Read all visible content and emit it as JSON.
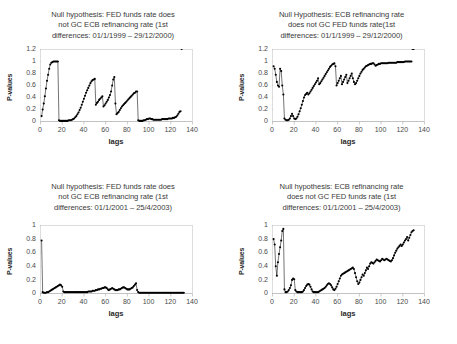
{
  "figure": {
    "panel_count": 4,
    "marker_color": "#000000",
    "frame_color": "#cfcfcf",
    "background": "#ffffff"
  },
  "chart_data": [
    {
      "type": "line",
      "panel": "top-left",
      "title": "Null hypothesis: FED funds rate does\nnot GC ECB refinancing rate (1st\ndifferences: 01/1/1999 – 29/12/2000)",
      "xlabel": "lags",
      "ylabel": "P-values",
      "xlim": [
        0,
        140
      ],
      "ylim": [
        0,
        1.2
      ],
      "xticks": [
        0,
        20,
        40,
        60,
        80,
        100,
        120,
        140
      ],
      "yticks": [
        0,
        0.2,
        0.4,
        0.6,
        0.8,
        1,
        1.2
      ],
      "grid": false,
      "legend": "none",
      "x": [
        1,
        2,
        3,
        4,
        5,
        6,
        7,
        8,
        9,
        10,
        11,
        12,
        13,
        14,
        15,
        16,
        17,
        18,
        19,
        20,
        21,
        22,
        23,
        24,
        25,
        26,
        27,
        28,
        29,
        30,
        31,
        32,
        33,
        34,
        35,
        36,
        37,
        38,
        39,
        40,
        41,
        42,
        43,
        44,
        45,
        46,
        47,
        48,
        49,
        50,
        51,
        52,
        53,
        54,
        55,
        56,
        57,
        58,
        59,
        60,
        61,
        62,
        63,
        64,
        65,
        66,
        67,
        68,
        69,
        70,
        71,
        72,
        73,
        74,
        75,
        76,
        77,
        78,
        79,
        80,
        81,
        82,
        83,
        84,
        85,
        86,
        87,
        88,
        89,
        90,
        91,
        92,
        93,
        94,
        95,
        96,
        97,
        98,
        99,
        100,
        101,
        102,
        103,
        104,
        105,
        106,
        107,
        108,
        109,
        110,
        111,
        112,
        113,
        114,
        115,
        116,
        117,
        118,
        119,
        120,
        121,
        122,
        123,
        124,
        125,
        126,
        127,
        128,
        129,
        130
      ],
      "y": [
        0.09,
        0.2,
        0.3,
        0.42,
        0.55,
        0.68,
        0.78,
        0.88,
        0.95,
        0.98,
        0.99,
        1.0,
        1.0,
        1.0,
        1.0,
        1.0,
        0.02,
        0.01,
        0.01,
        0.01,
        0.01,
        0.01,
        0.01,
        0.01,
        0.01,
        0.02,
        0.02,
        0.02,
        0.03,
        0.04,
        0.05,
        0.07,
        0.09,
        0.12,
        0.15,
        0.19,
        0.23,
        0.28,
        0.33,
        0.38,
        0.43,
        0.48,
        0.52,
        0.56,
        0.6,
        0.64,
        0.67,
        0.69,
        0.7,
        0.71,
        0.28,
        0.31,
        0.33,
        0.36,
        0.38,
        0.4,
        0.42,
        0.25,
        0.27,
        0.3,
        0.33,
        0.36,
        0.4,
        0.44,
        0.5,
        0.6,
        0.7,
        0.74,
        0.3,
        0.12,
        0.14,
        0.16,
        0.19,
        0.22,
        0.25,
        0.27,
        0.29,
        0.31,
        0.33,
        0.35,
        0.37,
        0.39,
        0.41,
        0.43,
        0.45,
        0.47,
        0.48,
        0.5,
        0.5,
        0.02,
        0.01,
        0.01,
        0.01,
        0.01,
        0.02,
        0.02,
        0.03,
        0.04,
        0.04,
        0.05,
        0.05,
        0.04,
        0.04,
        0.03,
        0.03,
        0.03,
        0.03,
        0.03,
        0.03,
        0.03,
        0.03,
        0.04,
        0.04,
        0.04,
        0.04,
        0.04,
        0.04,
        0.05,
        0.05,
        0.05,
        0.05,
        0.06,
        0.06,
        0.07,
        0.08,
        0.1,
        0.13,
        0.16,
        0.17
      ]
    },
    {
      "type": "line",
      "panel": "top-right",
      "title": "Null Hypothesis: ECB refinancing rate\ndoes not GC FED funds rate(1st\ndifferences: 01/1/1999 – 29/12/2000)",
      "xlabel": "lags",
      "ylabel": "P-values",
      "xlim": [
        0,
        140
      ],
      "ylim": [
        0,
        1.2
      ],
      "xticks": [
        0,
        20,
        40,
        60,
        80,
        100,
        120,
        140
      ],
      "yticks": [
        0,
        0.2,
        0.4,
        0.6,
        0.8,
        1,
        1.2
      ],
      "grid": false,
      "legend": "none",
      "x": [
        1,
        2,
        3,
        4,
        5,
        6,
        7,
        8,
        9,
        10,
        11,
        12,
        13,
        14,
        15,
        16,
        17,
        18,
        19,
        20,
        21,
        22,
        23,
        24,
        25,
        26,
        27,
        28,
        29,
        30,
        31,
        32,
        33,
        34,
        35,
        36,
        37,
        38,
        39,
        40,
        41,
        42,
        43,
        44,
        45,
        46,
        47,
        48,
        49,
        50,
        51,
        52,
        53,
        54,
        55,
        56,
        57,
        58,
        59,
        60,
        61,
        62,
        63,
        64,
        65,
        66,
        67,
        68,
        69,
        70,
        71,
        72,
        73,
        74,
        75,
        76,
        77,
        78,
        79,
        80,
        81,
        82,
        83,
        84,
        85,
        86,
        87,
        88,
        89,
        90,
        91,
        92,
        93,
        94,
        95,
        96,
        97,
        98,
        99,
        100,
        101,
        102,
        103,
        104,
        105,
        106,
        107,
        108,
        109,
        110,
        111,
        112,
        113,
        114,
        115,
        116,
        117,
        118,
        119,
        120,
        121,
        122,
        123,
        124,
        125,
        126,
        127,
        128,
        129,
        130
      ],
      "y": [
        0.92,
        0.88,
        0.78,
        0.66,
        0.6,
        0.58,
        0.88,
        0.84,
        0.6,
        0.45,
        0.05,
        0.03,
        0.02,
        0.02,
        0.03,
        0.05,
        0.09,
        0.13,
        0.09,
        0.05,
        0.04,
        0.05,
        0.08,
        0.12,
        0.17,
        0.22,
        0.28,
        0.34,
        0.4,
        0.44,
        0.46,
        0.48,
        0.45,
        0.47,
        0.5,
        0.53,
        0.56,
        0.59,
        0.62,
        0.65,
        0.68,
        0.72,
        0.62,
        0.64,
        0.67,
        0.7,
        0.73,
        0.76,
        0.79,
        0.82,
        0.85,
        0.88,
        0.91,
        0.93,
        0.95,
        0.96,
        0.97,
        0.92,
        0.6,
        0.64,
        0.68,
        0.72,
        0.76,
        0.62,
        0.66,
        0.7,
        0.74,
        0.78,
        0.64,
        0.68,
        0.72,
        0.76,
        0.8,
        0.72,
        0.66,
        0.62,
        0.64,
        0.68,
        0.72,
        0.76,
        0.8,
        0.83,
        0.86,
        0.88,
        0.9,
        0.92,
        0.93,
        0.94,
        0.95,
        0.96,
        0.96,
        0.97,
        0.97,
        0.95,
        0.93,
        0.94,
        0.95,
        0.96,
        0.96,
        0.97,
        0.97,
        0.97,
        0.97,
        0.97,
        0.97,
        0.97,
        0.98,
        0.98,
        0.98,
        0.98,
        0.98,
        0.98,
        0.98,
        0.98,
        0.99,
        0.99,
        0.99,
        0.99,
        0.99,
        0.99,
        0.99,
        1.0,
        1.0,
        1.0,
        1.0,
        1.0,
        1.0,
        1.0
      ]
    },
    {
      "type": "line",
      "panel": "bottom-left",
      "title": "Null hypothesis: FED funds rate does\nnot GC ECB refinancing rate (1st\ndifferences: 01/1/2001 – 25/4/2003)",
      "xlabel": "lags",
      "ylabel": "P-values",
      "xlim": [
        0,
        140
      ],
      "ylim": [
        0,
        1
      ],
      "xticks": [
        0,
        20,
        40,
        60,
        80,
        100,
        120,
        140
      ],
      "yticks": [
        0,
        0.2,
        0.4,
        0.6,
        0.8,
        1
      ],
      "grid": false,
      "legend": "none",
      "x": [
        1,
        2,
        3,
        4,
        5,
        6,
        7,
        8,
        9,
        10,
        11,
        12,
        13,
        14,
        15,
        16,
        17,
        18,
        19,
        20,
        21,
        22,
        23,
        24,
        25,
        26,
        27,
        28,
        29,
        30,
        31,
        32,
        33,
        34,
        35,
        36,
        37,
        38,
        39,
        40,
        41,
        42,
        43,
        44,
        45,
        46,
        47,
        48,
        49,
        50,
        51,
        52,
        53,
        54,
        55,
        56,
        57,
        58,
        59,
        60,
        61,
        62,
        63,
        64,
        65,
        66,
        67,
        68,
        69,
        70,
        71,
        72,
        73,
        74,
        75,
        76,
        77,
        78,
        79,
        80,
        81,
        82,
        83,
        84,
        85,
        86,
        87,
        88,
        89,
        90,
        91,
        92,
        93,
        94,
        95,
        96,
        97,
        98,
        99,
        100,
        101,
        102,
        103,
        104,
        105,
        106,
        107,
        108,
        109,
        110,
        111,
        112,
        113,
        114,
        115,
        116,
        117,
        118,
        119,
        120,
        121,
        122,
        123,
        124,
        125,
        126,
        127,
        128,
        129,
        130,
        131,
        132
      ],
      "y": [
        0.78,
        0.02,
        0.01,
        0.01,
        0.01,
        0.02,
        0.02,
        0.03,
        0.04,
        0.05,
        0.06,
        0.07,
        0.08,
        0.09,
        0.1,
        0.11,
        0.12,
        0.13,
        0.12,
        0.1,
        0.03,
        0.02,
        0.02,
        0.02,
        0.02,
        0.02,
        0.02,
        0.02,
        0.02,
        0.02,
        0.02,
        0.02,
        0.02,
        0.02,
        0.02,
        0.02,
        0.02,
        0.02,
        0.02,
        0.02,
        0.02,
        0.02,
        0.02,
        0.03,
        0.03,
        0.03,
        0.03,
        0.04,
        0.04,
        0.04,
        0.05,
        0.05,
        0.06,
        0.06,
        0.07,
        0.07,
        0.08,
        0.08,
        0.09,
        0.09,
        0.08,
        0.06,
        0.05,
        0.06,
        0.07,
        0.08,
        0.07,
        0.06,
        0.05,
        0.05,
        0.05,
        0.06,
        0.06,
        0.07,
        0.08,
        0.09,
        0.09,
        0.08,
        0.07,
        0.06,
        0.06,
        0.06,
        0.07,
        0.08,
        0.09,
        0.11,
        0.13,
        0.15,
        0.05,
        0.02,
        0.01,
        0.01,
        0.01,
        0.01,
        0.01,
        0.01,
        0.01,
        0.01,
        0.01,
        0.01,
        0.01,
        0.01,
        0.01,
        0.01,
        0.01,
        0.01,
        0.01,
        0.01,
        0.01,
        0.01,
        0.01,
        0.01,
        0.01,
        0.01,
        0.01,
        0.01,
        0.01,
        0.01,
        0.01,
        0.01,
        0.01,
        0.01,
        0.01,
        0.01,
        0.01,
        0.01,
        0.01,
        0.01,
        0.01,
        0.01,
        0.01,
        0.01
      ]
    },
    {
      "type": "line",
      "panel": "bottom-right",
      "title": "Null hypothesis: ECB refinancing rate\ndoes not GC FED funds rate (1st\ndifferences: 01/1/2001 – 25/4/2003)",
      "xlabel": "lags",
      "ylabel": "P-values",
      "xlim": [
        0,
        140
      ],
      "ylim": [
        0,
        1
      ],
      "xticks": [
        0,
        20,
        40,
        60,
        80,
        100,
        120,
        140
      ],
      "yticks": [
        0,
        0.2,
        0.4,
        0.6,
        0.8,
        1
      ],
      "grid": false,
      "legend": "none",
      "x": [
        1,
        2,
        3,
        4,
        5,
        6,
        7,
        8,
        9,
        10,
        11,
        12,
        13,
        14,
        15,
        16,
        17,
        18,
        19,
        20,
        21,
        22,
        23,
        24,
        25,
        26,
        27,
        28,
        29,
        30,
        31,
        32,
        33,
        34,
        35,
        36,
        37,
        38,
        39,
        40,
        41,
        42,
        43,
        44,
        45,
        46,
        47,
        48,
        49,
        50,
        51,
        52,
        53,
        54,
        55,
        56,
        57,
        58,
        59,
        60,
        61,
        62,
        63,
        64,
        65,
        66,
        67,
        68,
        69,
        70,
        71,
        72,
        73,
        74,
        75,
        76,
        77,
        78,
        79,
        80,
        81,
        82,
        83,
        84,
        85,
        86,
        87,
        88,
        89,
        90,
        91,
        92,
        93,
        94,
        95,
        96,
        97,
        98,
        99,
        100,
        101,
        102,
        103,
        104,
        105,
        106,
        107,
        108,
        109,
        110,
        111,
        112,
        113,
        114,
        115,
        116,
        117,
        118,
        119,
        120,
        121,
        122,
        123,
        124,
        125,
        126,
        127,
        128,
        129,
        130
      ],
      "y": [
        0.8,
        0.72,
        0.4,
        0.26,
        0.46,
        0.58,
        0.68,
        0.78,
        0.92,
        0.95,
        0.06,
        0.02,
        0.02,
        0.03,
        0.05,
        0.08,
        0.12,
        0.2,
        0.22,
        0.21,
        0.05,
        0.03,
        0.02,
        0.02,
        0.02,
        0.02,
        0.02,
        0.03,
        0.05,
        0.08,
        0.11,
        0.13,
        0.14,
        0.13,
        0.1,
        0.06,
        0.03,
        0.02,
        0.02,
        0.02,
        0.02,
        0.02,
        0.03,
        0.04,
        0.05,
        0.06,
        0.07,
        0.08,
        0.1,
        0.12,
        0.14,
        0.15,
        0.14,
        0.12,
        0.09,
        0.06,
        0.05,
        0.07,
        0.1,
        0.14,
        0.18,
        0.22,
        0.26,
        0.28,
        0.29,
        0.3,
        0.31,
        0.32,
        0.33,
        0.34,
        0.35,
        0.36,
        0.37,
        0.38,
        0.36,
        0.3,
        0.24,
        0.18,
        0.14,
        0.16,
        0.2,
        0.24,
        0.28,
        0.26,
        0.3,
        0.34,
        0.38,
        0.36,
        0.4,
        0.44,
        0.46,
        0.45,
        0.44,
        0.46,
        0.48,
        0.5,
        0.49,
        0.48,
        0.47,
        0.49,
        0.51,
        0.5,
        0.49,
        0.5,
        0.51,
        0.5,
        0.49,
        0.48,
        0.47,
        0.49,
        0.52,
        0.56,
        0.6,
        0.63,
        0.66,
        0.68,
        0.7,
        0.72,
        0.7,
        0.72,
        0.75,
        0.78,
        0.8,
        0.83,
        0.78,
        0.82,
        0.86,
        0.9,
        0.92,
        0.93
      ]
    }
  ]
}
